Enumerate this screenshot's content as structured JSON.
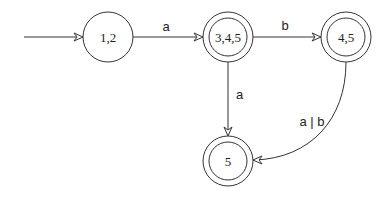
{
  "diagram": {
    "type": "dfa",
    "states": [
      {
        "id": "s12",
        "label": "1,2",
        "accepting": false,
        "start": true,
        "cx": 108,
        "cy": 37
      },
      {
        "id": "s345",
        "label": "3,4,5",
        "accepting": true,
        "start": false,
        "cx": 228,
        "cy": 37
      },
      {
        "id": "s45",
        "label": "4,5",
        "accepting": true,
        "start": false,
        "cx": 346,
        "cy": 37
      },
      {
        "id": "s5",
        "label": "5",
        "accepting": true,
        "start": false,
        "cx": 228,
        "cy": 161
      }
    ],
    "transitions": [
      {
        "from": "s12",
        "to": "s345",
        "label": "a"
      },
      {
        "from": "s345",
        "to": "s45",
        "label": "b"
      },
      {
        "from": "s345",
        "to": "s5",
        "label": "a"
      },
      {
        "from": "s45",
        "to": "s5",
        "label": "a | b"
      }
    ],
    "colors": {
      "stroke": "#333333",
      "background": "#ffffff",
      "text": "#222222"
    }
  }
}
